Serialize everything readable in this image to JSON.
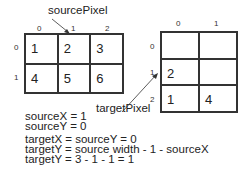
{
  "source": {
    "label": "sourcePixel",
    "col_indices": [
      "0",
      "1",
      "2"
    ],
    "row_indices": [
      "0",
      "1"
    ],
    "cells": [
      [
        "1",
        "2",
        "3"
      ],
      [
        "4",
        "5",
        "6"
      ]
    ]
  },
  "target": {
    "label": "targetPixel",
    "col_indices": [
      "0",
      "1"
    ],
    "row_indices": [
      "0",
      "1",
      "2"
    ],
    "cells": [
      [
        "",
        ""
      ],
      [
        "2",
        ""
      ],
      [
        "1",
        "4"
      ]
    ]
  },
  "equations": [
    "sourceX = 1",
    "sourceY = 0",
    "targetX = sourceY = 0",
    "targetY = source width - 1 - sourceX",
    "targetY = 3 - 1 - 1 = 1"
  ]
}
